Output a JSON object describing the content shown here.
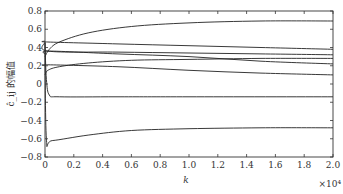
{
  "chart_data": {
    "type": "line",
    "title": "",
    "xlabel": "k",
    "x_multiplier": "×10⁴",
    "ylabel": "ĉ_ij 的幅值",
    "xlim": [
      0,
      2.0
    ],
    "ylim": [
      -0.8,
      0.8
    ],
    "grid": false,
    "legend": null,
    "x_ticks": [
      "0",
      "0.2",
      "0.4",
      "0.6",
      "0.8",
      "1.0",
      "1.2",
      "1.4",
      "1.6",
      "1.8",
      "2.0"
    ],
    "y_ticks": [
      "0.8",
      "0.6",
      "0.4",
      "0.2",
      "0",
      "−0.2",
      "−0.4",
      "−0.6",
      "−0.8"
    ],
    "series": [
      {
        "name": "curve-1",
        "x": [
          0,
          0.03,
          0.1,
          0.3,
          0.6,
          1.0,
          1.5,
          2.0
        ],
        "values": [
          0.3,
          0.38,
          0.46,
          0.56,
          0.63,
          0.67,
          0.69,
          0.69
        ]
      },
      {
        "name": "curve-2",
        "x": [
          0,
          0.02,
          0.5,
          1.0,
          1.5,
          2.0
        ],
        "values": [
          0.47,
          0.46,
          0.44,
          0.42,
          0.4,
          0.38
        ]
      },
      {
        "name": "curve-3",
        "x": [
          0,
          0.02,
          0.5,
          1.0,
          1.5,
          2.0
        ],
        "values": [
          0.46,
          0.36,
          0.35,
          0.34,
          0.33,
          0.32
        ]
      },
      {
        "name": "curve-4",
        "x": [
          0,
          0.03,
          0.5,
          1.0,
          1.5,
          2.0
        ],
        "values": [
          0.33,
          0.36,
          0.33,
          0.3,
          0.25,
          0.22
        ]
      },
      {
        "name": "curve-5",
        "x": [
          0,
          0.02,
          0.1,
          0.3,
          0.6,
          1.0,
          1.5,
          2.0
        ],
        "values": [
          0.1,
          0.15,
          0.19,
          0.23,
          0.26,
          0.27,
          0.28,
          0.28
        ]
      },
      {
        "name": "curve-6",
        "x": [
          0,
          0.02,
          0.5,
          1.0,
          1.5,
          2.0
        ],
        "values": [
          0.2,
          0.21,
          0.19,
          0.15,
          0.12,
          0.1
        ]
      },
      {
        "name": "curve-7",
        "x": [
          0,
          0.01,
          0.03,
          0.1,
          0.5,
          1.0,
          2.0
        ],
        "values": [
          0.45,
          0.05,
          -0.12,
          -0.14,
          -0.14,
          -0.14,
          -0.14
        ]
      },
      {
        "name": "curve-8",
        "x": [
          0,
          0.01,
          0.05,
          0.3,
          0.6,
          1.0,
          1.5,
          2.0
        ],
        "values": [
          0.45,
          -0.6,
          -0.62,
          -0.56,
          -0.51,
          -0.49,
          -0.48,
          -0.48
        ]
      }
    ]
  }
}
